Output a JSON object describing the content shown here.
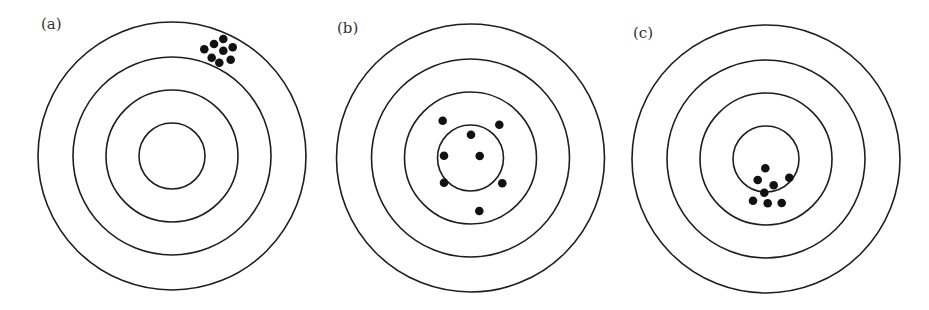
{
  "figure": {
    "width": 929,
    "height": 310,
    "colors": {
      "background": "#ffffff",
      "ring_stroke": "#1e1e1e",
      "hit": "#111111",
      "label": "#333333"
    },
    "ring_radii": [
      134,
      99,
      66,
      33
    ],
    "hit_radius": 4.3,
    "panels": [
      {
        "id": "a",
        "label": "(a)",
        "label_pos": [
          41,
          17
        ],
        "center": [
          172,
          156
        ],
        "hits": [
          [
            204.3,
            49.3
          ],
          [
            214,
            44
          ],
          [
            223.3,
            39
          ],
          [
            232.7,
            47.3
          ],
          [
            223.3,
            50.7
          ],
          [
            211.7,
            57.7
          ],
          [
            219.3,
            62.7
          ],
          [
            230.7,
            59.7
          ]
        ]
      },
      {
        "id": "b",
        "label": "(b)",
        "label_pos": [
          337,
          21
        ],
        "center": [
          470.5,
          158
        ],
        "hits": [
          [
            442.7,
            120.7
          ],
          [
            499.3,
            124.7
          ],
          [
            471,
            134.7
          ],
          [
            444,
            155.7
          ],
          [
            479.7,
            156
          ],
          [
            444,
            182.7
          ],
          [
            502.3,
            183.3
          ],
          [
            479.3,
            211
          ]
        ]
      },
      {
        "id": "c",
        "label": "(c)",
        "label_pos": [
          633,
          26
        ],
        "center": [
          766,
          159
        ],
        "hits": [
          [
            765.3,
            168.3
          ],
          [
            757.7,
            180
          ],
          [
            789.3,
            177.7
          ],
          [
            773.7,
            185.3
          ],
          [
            764.3,
            192.7
          ],
          [
            753,
            200.7
          ],
          [
            767.7,
            203.3
          ],
          [
            781.7,
            203
          ]
        ]
      }
    ]
  },
  "labels": {
    "a": "(a)",
    "b": "(b)",
    "c": "(c)"
  }
}
